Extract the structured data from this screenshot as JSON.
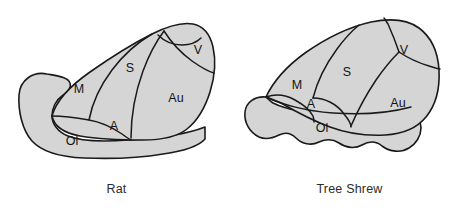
{
  "figure": {
    "background_color": "#ffffff",
    "fill_color": "#d5d5d5",
    "outline_color": "#1a1a1a"
  },
  "panels": [
    {
      "id": "rat",
      "caption": "Rat",
      "regions": [
        {
          "key": "M",
          "label": "M",
          "name": "motor-cortex"
        },
        {
          "key": "S",
          "label": "S",
          "name": "somatosensory-cortex"
        },
        {
          "key": "V",
          "label": "V",
          "name": "visual-cortex"
        },
        {
          "key": "Au",
          "label": "Au",
          "name": "auditory-cortex"
        },
        {
          "key": "A",
          "label": "A",
          "name": "a-area"
        },
        {
          "key": "Ol",
          "label": "Ol",
          "name": "olfactory-area"
        }
      ]
    },
    {
      "id": "tree_shrew",
      "caption": "Tree Shrew",
      "regions": [
        {
          "key": "M",
          "label": "M",
          "name": "motor-cortex"
        },
        {
          "key": "S",
          "label": "S",
          "name": "somatosensory-cortex"
        },
        {
          "key": "V",
          "label": "V",
          "name": "visual-cortex"
        },
        {
          "key": "Au",
          "label": "Au",
          "name": "auditory-cortex"
        },
        {
          "key": "A",
          "label": "A",
          "name": "a-area"
        },
        {
          "key": "Ol",
          "label": "Ol",
          "name": "olfactory-area"
        }
      ]
    }
  ]
}
